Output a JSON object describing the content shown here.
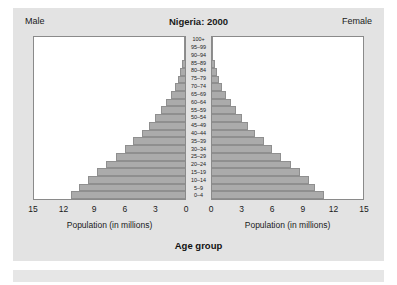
{
  "header": {
    "male_label": "Male",
    "female_label": "Female",
    "title": "Nigeria: 2000"
  },
  "axis": {
    "male_title": "Population (in millions)",
    "female_title": "Population (in millions)",
    "group_title": "Age group",
    "male_ticks": [
      "15",
      "12",
      "9",
      "6",
      "3",
      "0"
    ],
    "female_ticks": [
      "0",
      "3",
      "6",
      "9",
      "12",
      "15"
    ]
  },
  "colors": {
    "bar_fill": "#ababab",
    "bar_edge": "#8f8f8f",
    "panel_bg": "#ffffff",
    "figure_bg": "#e3e3e3",
    "text": "#1a1a1a"
  },
  "chart_data": {
    "type": "bar",
    "title": "Nigeria: 2000",
    "subtitle": "",
    "orientation": "horizontal",
    "layout": "population-pyramid",
    "xlabel": "Population (in millions)",
    "ylabel": "Age group",
    "xlim": [
      0,
      15
    ],
    "grid": false,
    "legend": "none",
    "categories": [
      "100+",
      "95-99",
      "90-94",
      "85-89",
      "80-84",
      "75-79",
      "70-74",
      "65-69",
      "60-64",
      "55-59",
      "50-54",
      "45-49",
      "40-44",
      "35-39",
      "30-34",
      "25-29",
      "20-24",
      "15-19",
      "10-14",
      "5-9",
      "0-4"
    ],
    "series": [
      {
        "name": "Male",
        "direction": "left",
        "values": [
          0.02,
          0.06,
          0.13,
          0.25,
          0.45,
          0.7,
          1.0,
          1.4,
          1.9,
          2.4,
          3.0,
          3.6,
          4.3,
          5.2,
          6.0,
          6.9,
          7.8,
          8.7,
          9.6,
          10.5,
          11.3
        ]
      },
      {
        "name": "Female",
        "direction": "right",
        "values": [
          0.02,
          0.06,
          0.13,
          0.25,
          0.45,
          0.7,
          1.0,
          1.4,
          1.9,
          2.4,
          3.0,
          3.6,
          4.3,
          5.2,
          6.0,
          6.9,
          7.8,
          8.7,
          9.6,
          10.2,
          11.1
        ]
      }
    ]
  }
}
